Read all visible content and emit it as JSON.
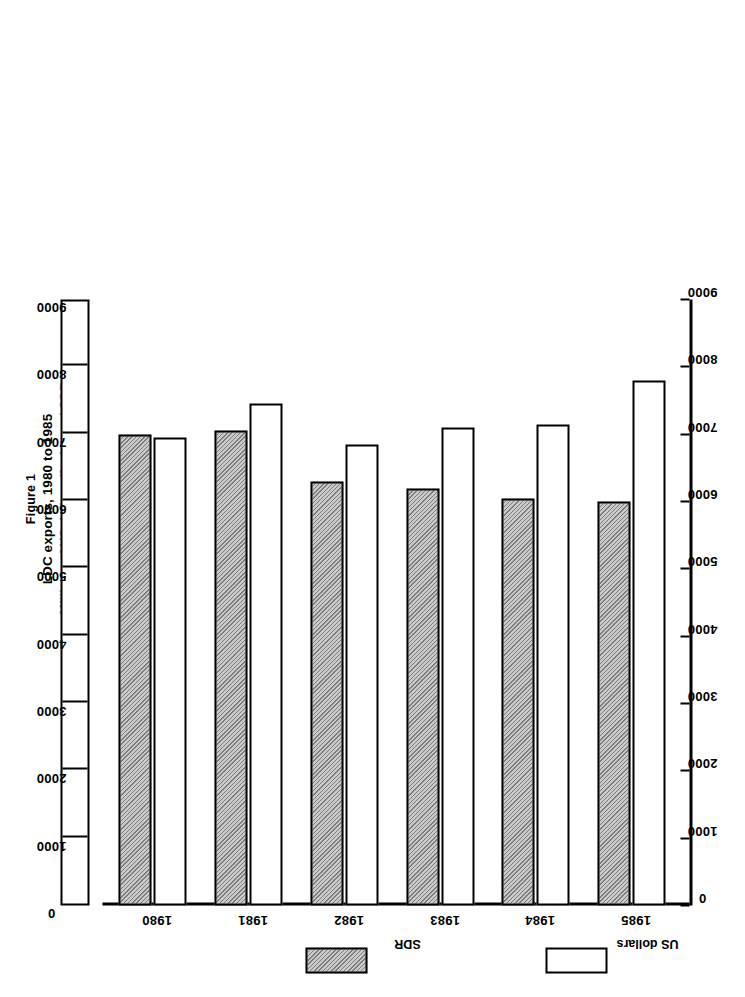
{
  "figure": {
    "label": "Figure 1",
    "title": "LDC exports, 1980 to 1985",
    "subtitle": "Millions of US dollars (f.o.b.) and SDR"
  },
  "legend": {
    "usd_label": "US dollars",
    "sdr_label": "SDR"
  },
  "colors": {
    "usd_fill": "#ffffff",
    "sdr_fill": "#c9c9c9",
    "line": "#000000"
  },
  "chart_data": {
    "type": "bar",
    "orientation": "horizontal",
    "title": "LDC exports, 1980 to 1985",
    "subtitle": "Millions of US dollars (f.o.b.) and SDR",
    "xlabel": "",
    "ylabel": "",
    "categories": [
      "1980",
      "1981",
      "1982",
      "1983",
      "1984",
      "1985"
    ],
    "series": [
      {
        "name": "US dollars",
        "values": [
          7800,
          7150,
          7100,
          6850,
          7450,
          6950
        ]
      },
      {
        "name": "SDR",
        "values": [
          6000,
          6050,
          6200,
          6300,
          7050,
          7000
        ]
      }
    ],
    "axis_ticks": [
      0,
      1000,
      2000,
      3000,
      4000,
      5000,
      6000,
      7000,
      8000,
      9000
    ],
    "axis_tick_labels": [
      "0",
      "1000",
      "2000",
      "3000",
      "4000",
      "5000",
      "6000",
      "7000",
      "8000",
      "9000"
    ],
    "xlim": [
      0,
      9000
    ],
    "grid": false,
    "legend_position": "left-outside"
  }
}
